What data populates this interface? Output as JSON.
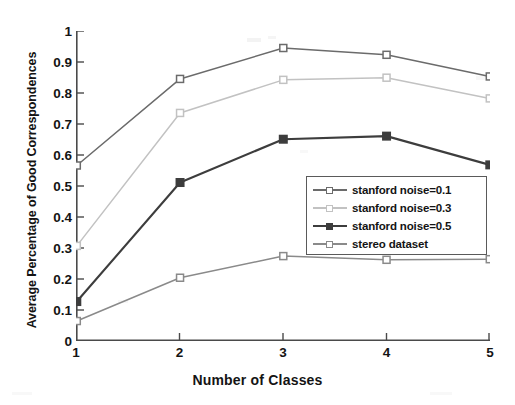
{
  "chart_data": {
    "type": "line",
    "title": "",
    "xlabel": "Number of Classes",
    "ylabel": "Average Percentage of Good Correspondences",
    "x": [
      1,
      2,
      3,
      4,
      5
    ],
    "categories": [
      "1",
      "2",
      "3",
      "4",
      "5"
    ],
    "xlim": [
      1,
      5
    ],
    "ylim": [
      0,
      1
    ],
    "xticks": [
      "1",
      "2",
      "3",
      "4",
      "5"
    ],
    "yticks": [
      "0",
      "0.1",
      "0.2",
      "0.3",
      "0.4",
      "0.5",
      "0.6",
      "0.7",
      "0.8",
      "0.9",
      "1"
    ],
    "ytick_values": [
      0,
      0.1,
      0.2,
      0.3,
      0.4,
      0.5,
      0.6,
      0.7,
      0.8,
      0.9,
      1
    ],
    "grid": false,
    "legend_position": "lower-right-inside",
    "marker": "square",
    "series": [
      {
        "name": "stanford noise=0.1",
        "color": "#6b6b6b",
        "values": [
          0.565,
          0.845,
          0.945,
          0.923,
          0.853
        ]
      },
      {
        "name": "stanford noise=0.3",
        "color": "#c2c2c2",
        "values": [
          0.305,
          0.735,
          0.842,
          0.849,
          0.782
        ]
      },
      {
        "name": "stanford noise=0.5",
        "color": "#3d3d3d",
        "values": [
          0.125,
          0.51,
          0.65,
          0.66,
          0.567
        ]
      },
      {
        "name": "stereo dataset",
        "color": "#8a8a8a",
        "values": [
          0.062,
          0.202,
          0.272,
          0.26,
          0.262
        ]
      }
    ]
  },
  "axes": {
    "x_label": "Number of Classes",
    "y_label": "Average Percentage of Good Correspondences",
    "x_ticks": [
      "1",
      "2",
      "3",
      "4",
      "5"
    ],
    "y_ticks": [
      "1",
      "0.9",
      "0.8",
      "0.7",
      "0.6",
      "0.5",
      "0.4",
      "0.3",
      "0.2",
      "0.1",
      "0"
    ]
  },
  "legend": {
    "items": [
      {
        "label": "stanford noise=0.1",
        "color": "#6b6b6b"
      },
      {
        "label": "stanford noise=0.3",
        "color": "#c2c2c2"
      },
      {
        "label": "stanford noise=0.5",
        "color": "#3d3d3d"
      },
      {
        "label": "stereo dataset",
        "color": "#8a8a8a"
      }
    ]
  },
  "style": {
    "background": "#ffffff",
    "axis_color": "#4a4a4a",
    "text_color": "#141414"
  }
}
